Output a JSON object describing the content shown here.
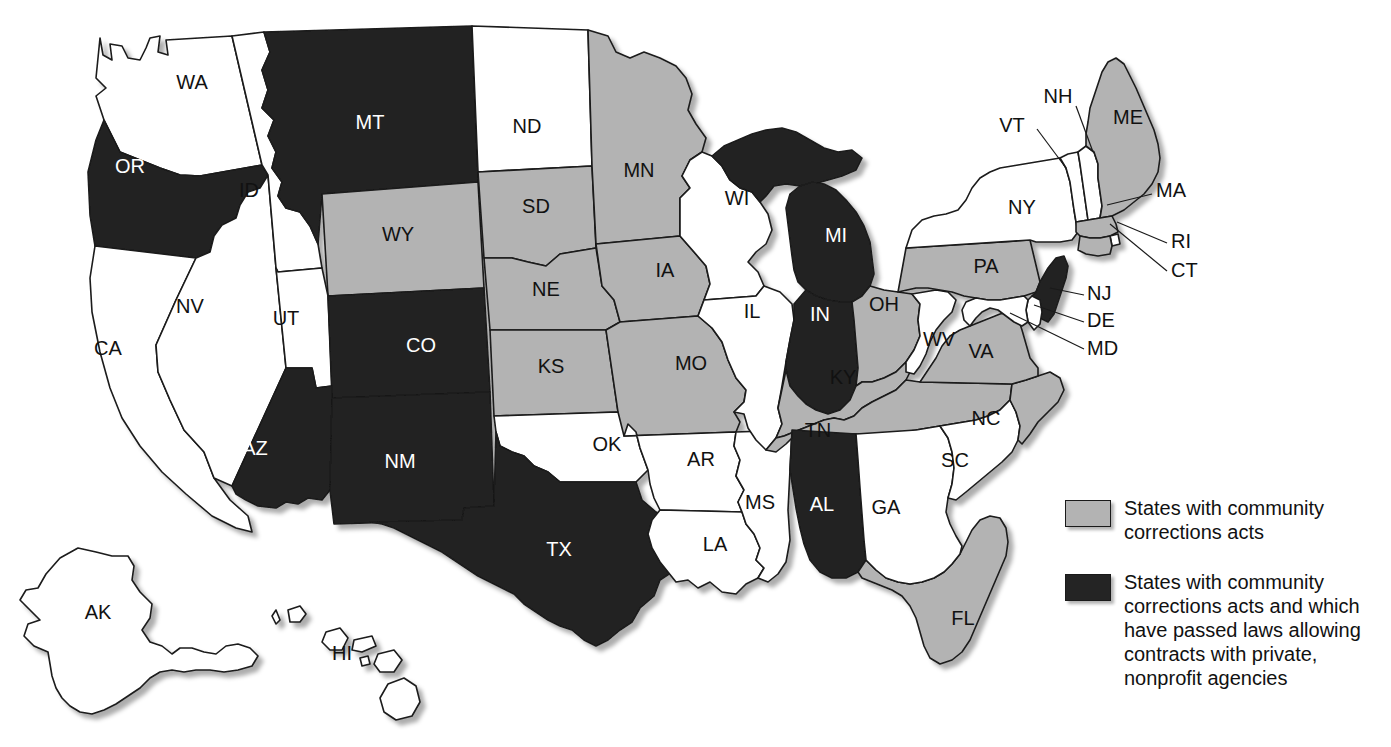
{
  "figure": {
    "type": "choropleth-map",
    "region": "United States",
    "background_color": "#ffffff"
  },
  "colors": {
    "none": "#ffffff",
    "gray": "#b3b3b3",
    "dark": "#242424",
    "outline": "#1a1a1a",
    "label_on_dark": "#ffffff",
    "label_on_light": "#111111"
  },
  "legend": {
    "items": [
      {
        "swatch": "gray",
        "color": "#b3b3b3",
        "text": "States with community\ncorrections acts"
      },
      {
        "swatch": "dark",
        "color": "#242424",
        "text": "States with community\ncorrections acts and which\nhave passed laws allowing\ncontracts with private,\nnonprofit agencies"
      }
    ]
  },
  "map": {
    "categories": {
      "none": "No community corrections act",
      "gray": "States with community corrections acts",
      "dark": "States with community corrections acts and which have passed laws allowing contracts with private, nonprofit agencies"
    },
    "states": [
      {
        "code": "WA",
        "fill": "none",
        "label_x": 192,
        "label_y": 84
      },
      {
        "code": "OR",
        "fill": "dark",
        "label_x": 130,
        "label_y": 168
      },
      {
        "code": "CA",
        "fill": "none",
        "label_x": 108,
        "label_y": 350
      },
      {
        "code": "NV",
        "fill": "none",
        "label_x": 190,
        "label_y": 308
      },
      {
        "code": "ID",
        "fill": "none",
        "label_x": 249,
        "label_y": 192
      },
      {
        "code": "MT",
        "fill": "dark",
        "label_x": 370,
        "label_y": 124
      },
      {
        "code": "WY",
        "fill": "gray",
        "label_x": 398,
        "label_y": 236
      },
      {
        "code": "UT",
        "fill": "none",
        "label_x": 286,
        "label_y": 320
      },
      {
        "code": "AZ",
        "fill": "dark",
        "label_x": 255,
        "label_y": 450
      },
      {
        "code": "NM",
        "fill": "dark",
        "label_x": 400,
        "label_y": 463
      },
      {
        "code": "CO",
        "fill": "dark",
        "label_x": 421,
        "label_y": 347
      },
      {
        "code": "ND",
        "fill": "none",
        "label_x": 527,
        "label_y": 128
      },
      {
        "code": "SD",
        "fill": "gray",
        "label_x": 536,
        "label_y": 208
      },
      {
        "code": "NE",
        "fill": "gray",
        "label_x": 546,
        "label_y": 291
      },
      {
        "code": "KS",
        "fill": "gray",
        "label_x": 551,
        "label_y": 368
      },
      {
        "code": "OK",
        "fill": "none",
        "label_x": 607,
        "label_y": 446
      },
      {
        "code": "TX",
        "fill": "dark",
        "label_x": 559,
        "label_y": 551
      },
      {
        "code": "MN",
        "fill": "gray",
        "label_x": 639,
        "label_y": 172
      },
      {
        "code": "IA",
        "fill": "gray",
        "label_x": 665,
        "label_y": 272
      },
      {
        "code": "MO",
        "fill": "gray",
        "label_x": 691,
        "label_y": 365
      },
      {
        "code": "AR",
        "fill": "none",
        "label_x": 701,
        "label_y": 461
      },
      {
        "code": "LA",
        "fill": "none",
        "label_x": 715,
        "label_y": 546
      },
      {
        "code": "MS",
        "fill": "none",
        "label_x": 760,
        "label_y": 504
      },
      {
        "code": "WI",
        "fill": "none",
        "label_x": 737,
        "label_y": 200
      },
      {
        "code": "IL",
        "fill": "none",
        "label_x": 752,
        "label_y": 313
      },
      {
        "code": "MI",
        "fill": "dark",
        "label_x": 836,
        "label_y": 237
      },
      {
        "code": "IN",
        "fill": "dark",
        "label_x": 820,
        "label_y": 316
      },
      {
        "code": "KY",
        "fill": "gray",
        "label_x": 843,
        "label_y": 379
      },
      {
        "code": "TN",
        "fill": "gray",
        "label_x": 818,
        "label_y": 432
      },
      {
        "code": "AL",
        "fill": "dark",
        "label_x": 822,
        "label_y": 506
      },
      {
        "code": "OH",
        "fill": "gray",
        "label_x": 884,
        "label_y": 306
      },
      {
        "code": "GA",
        "fill": "none",
        "label_x": 886,
        "label_y": 509
      },
      {
        "code": "FL",
        "fill": "gray",
        "label_x": 963,
        "label_y": 620
      },
      {
        "code": "SC",
        "fill": "none",
        "label_x": 955,
        "label_y": 462
      },
      {
        "code": "NC",
        "fill": "gray",
        "label_x": 986,
        "label_y": 420
      },
      {
        "code": "VA",
        "fill": "gray",
        "label_x": 981,
        "label_y": 353
      },
      {
        "code": "WV",
        "fill": "none",
        "label_x": 939,
        "label_y": 341
      },
      {
        "code": "PA",
        "fill": "gray",
        "label_x": 986,
        "label_y": 268
      },
      {
        "code": "NY",
        "fill": "none",
        "label_x": 1022,
        "label_y": 209
      },
      {
        "code": "ME",
        "fill": "gray",
        "label_x": 1128,
        "label_y": 119
      },
      {
        "code": "AK",
        "fill": "none",
        "label_x": 98,
        "label_y": 614
      },
      {
        "code": "HI",
        "fill": "none",
        "label_x": 342,
        "label_y": 655
      }
    ],
    "callouts": [
      {
        "code": "VT",
        "fill": "none",
        "text_x": 1012,
        "text_y": 127,
        "line": [
          [
            1037,
            129
          ],
          [
            1066,
            168
          ]
        ]
      },
      {
        "code": "NH",
        "fill": "none",
        "text_x": 1058,
        "text_y": 98,
        "line": [
          [
            1076,
            106
          ],
          [
            1093,
            152
          ]
        ]
      },
      {
        "code": "MA",
        "fill": "gray",
        "text_x": 1156,
        "text_y": 192,
        "line": [
          [
            1152,
            194
          ],
          [
            1107,
            205
          ]
        ]
      },
      {
        "code": "RI",
        "fill": "none",
        "text_x": 1171,
        "text_y": 243,
        "line": [
          [
            1167,
            243
          ],
          [
            1117,
            222
          ]
        ]
      },
      {
        "code": "CT",
        "fill": "gray",
        "text_x": 1171,
        "text_y": 272,
        "line": [
          [
            1167,
            271
          ],
          [
            1110,
            224
          ]
        ]
      },
      {
        "code": "NJ",
        "fill": "dark",
        "text_x": 1087,
        "text_y": 295,
        "line": [
          [
            1084,
            295
          ],
          [
            1050,
            288
          ]
        ]
      },
      {
        "code": "DE",
        "fill": "none",
        "text_x": 1087,
        "text_y": 322,
        "line": [
          [
            1084,
            322
          ],
          [
            1034,
            305
          ]
        ]
      },
      {
        "code": "MD",
        "fill": "none",
        "text_x": 1087,
        "text_y": 350,
        "line": [
          [
            1084,
            349
          ],
          [
            1010,
            313
          ]
        ]
      }
    ]
  }
}
